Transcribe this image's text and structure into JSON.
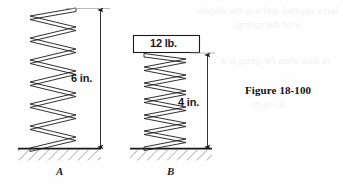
{
  "figure": {
    "caption": "Figure  18-100",
    "background_color": "#fefefe",
    "ink_color": "#1a1a1a",
    "ghost_color": "#f2f2f2"
  },
  "spring_a": {
    "part_label": "A",
    "dimension_label": "6 in.",
    "dimension_value": 6,
    "dimension_unit": "in.",
    "load_label": "",
    "coil_count": 8,
    "free_length_px": 136,
    "state": "unloaded"
  },
  "spring_b": {
    "part_label": "B",
    "dimension_label": "4 in.",
    "dimension_value": 4,
    "dimension_unit": "in.",
    "load_label": "12 lb.",
    "load_value": 12,
    "load_unit": "lb.",
    "coil_count": 11,
    "compressed_length_px": 93,
    "state": "loaded"
  },
  "ghost_text": {
    "line1": "have applied and x is the displac",
    "line2": "y of the spring.",
    "line3": "rk done when the spring is st",
    "line4": "8.5 in-lb"
  }
}
